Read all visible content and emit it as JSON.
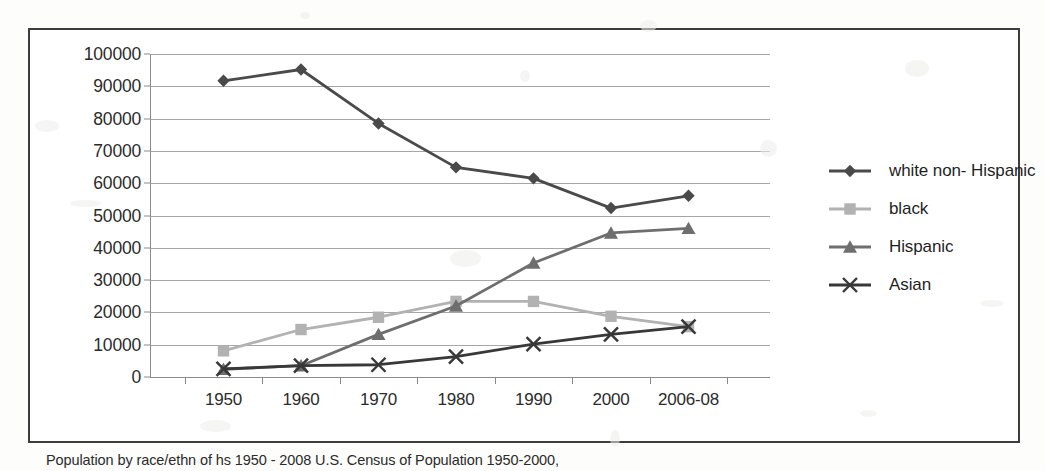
{
  "caption": "Population by race/ethn of hs 1950 - 2008 U.S. Census of Population 1950-2000,",
  "colors": {
    "white_non_hispanic": "#4a4a4a",
    "black": "#b2b2b2",
    "hispanic": "#6e6e6e",
    "asian": "#383838",
    "gridline": "#a6a6a6",
    "frame": "#3d3d3d",
    "text": "#2b2b2b"
  },
  "legend": {
    "position": "right",
    "items": [
      {
        "label": "white non- Hispanic",
        "marker": "diamond-marker-icon",
        "color": "#4a4a4a"
      },
      {
        "label": "black",
        "marker": "square-marker-icon",
        "color": "#b2b2b2"
      },
      {
        "label": "Hispanic",
        "marker": "triangle-marker-icon",
        "color": "#6e6e6e"
      },
      {
        "label": "Asian",
        "marker": "cross-marker-icon",
        "color": "#383838"
      }
    ]
  },
  "axes": {
    "y_ticks": [
      "100000",
      "90000",
      "80000",
      "70000",
      "60000",
      "50000",
      "40000",
      "30000",
      "20000",
      "10000",
      "0"
    ],
    "x_ticks": [
      "1950",
      "1960",
      "1970",
      "1980",
      "1990",
      "2000",
      "2006-08"
    ]
  },
  "chart_data": {
    "type": "line",
    "title": "",
    "subtitle": "",
    "xlabel": "",
    "ylabel": "",
    "categories": [
      "1950",
      "1960",
      "1970",
      "1980",
      "1990",
      "2000",
      "2006-08"
    ],
    "ylim": [
      0,
      100000
    ],
    "ytick_step": 10000,
    "xlim_categorical": true,
    "grid": "horizontal",
    "legend_position": "right",
    "series": [
      {
        "name": "white non- Hispanic",
        "marker": "diamond",
        "color": "#4a4a4a",
        "values": [
          91700,
          95200,
          78500,
          64900,
          61500,
          52300,
          56100
        ]
      },
      {
        "name": "black",
        "marker": "square",
        "color": "#b2b2b2",
        "values": [
          8100,
          14700,
          18500,
          23400,
          23400,
          18800,
          15600
        ]
      },
      {
        "name": "Hispanic",
        "marker": "triangle",
        "color": "#6e6e6e",
        "values": [
          2400,
          3500,
          13200,
          22000,
          35300,
          44600,
          46000
        ]
      },
      {
        "name": "Asian",
        "marker": "cross",
        "color": "#383838",
        "values": [
          2500,
          3500,
          3800,
          6300,
          10200,
          13200,
          15600
        ]
      }
    ]
  }
}
